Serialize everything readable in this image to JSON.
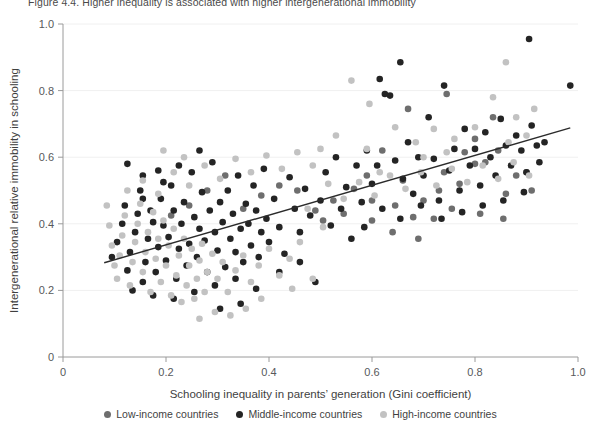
{
  "figure": {
    "title": "Figure 4.4. Higher inequality is associated with higher intergenerational immobility"
  },
  "legend": {
    "position": "bottom-center",
    "items": [
      {
        "label": "Low-income countries",
        "color": "#6e6e6e",
        "icon": "circle-marker-icon"
      },
      {
        "label": "Middle-income countries",
        "color": "#242424",
        "icon": "circle-marker-icon"
      },
      {
        "label": "High-income countries",
        "color": "#c2c2c2",
        "icon": "circle-marker-icon"
      }
    ]
  },
  "chart_data": {
    "type": "scatter",
    "title": "Figure 4.4. Higher inequality is associated with higher intergenerational immobility",
    "xlabel": "Schooling inequality in parents’ generation (Gini coefficient)",
    "ylabel": "Intergenerational relative immobility in schooling",
    "xlim": [
      0,
      1.0
    ],
    "ylim": [
      0,
      1.0
    ],
    "xticks": [
      0,
      0.2,
      0.4,
      0.6,
      0.8,
      1.0
    ],
    "xticklabels": [
      "0",
      "0.2",
      "0.4",
      "0.6",
      "0.8",
      "1.0"
    ],
    "yticks": [
      0,
      0.2,
      0.4,
      0.6,
      0.8,
      1.0
    ],
    "yticklabels": [
      "0",
      "0.2",
      "0.4",
      "0.6",
      "0.8",
      "1.0"
    ],
    "grid": "horizontal-light",
    "trendline": {
      "type": "linear",
      "x_start": 0.08,
      "y_start": 0.283,
      "x_end": 0.985,
      "y_end": 0.688,
      "color": "#2b2b2b",
      "width": 1.4
    },
    "series": [
      {
        "name": "Low-income countries",
        "color": "#6e6e6e",
        "points": [
          [
            0.62,
            0.62
          ],
          [
            0.66,
            0.53
          ],
          [
            0.7,
            0.47
          ],
          [
            0.74,
            0.555
          ],
          [
            0.78,
            0.615
          ],
          [
            0.8,
            0.58
          ],
          [
            0.82,
            0.585
          ],
          [
            0.845,
            0.62
          ],
          [
            0.86,
            0.49
          ],
          [
            0.88,
            0.545
          ],
          [
            0.9,
            0.555
          ],
          [
            0.91,
            0.5
          ],
          [
            0.755,
            0.445
          ],
          [
            0.72,
            0.415
          ],
          [
            0.68,
            0.42
          ],
          [
            0.645,
            0.455
          ],
          [
            0.6,
            0.47
          ],
          [
            0.565,
            0.505
          ],
          [
            0.525,
            0.47
          ],
          [
            0.49,
            0.44
          ],
          [
            0.455,
            0.5
          ],
          [
            0.42,
            0.515
          ],
          [
            0.385,
            0.485
          ],
          [
            0.35,
            0.445
          ],
          [
            0.6,
            0.41
          ],
          [
            0.64,
            0.375
          ],
          [
            0.69,
            0.355
          ],
          [
            0.73,
            0.5
          ],
          [
            0.77,
            0.52
          ],
          [
            0.81,
            0.43
          ],
          [
            0.855,
            0.415
          ],
          [
            0.67,
            0.745
          ],
          [
            0.745,
            0.79
          ],
          [
            0.505,
            0.41
          ],
          [
            0.545,
            0.43
          ],
          [
            0.59,
            0.545
          ],
          [
            0.315,
            0.545
          ],
          [
            0.28,
            0.5
          ],
          [
            0.245,
            0.455
          ],
          [
            0.21,
            0.425
          ],
          [
            0.8,
            0.655
          ],
          [
            0.835,
            0.72
          ]
        ]
      },
      {
        "name": "Middle-income countries",
        "color": "#242424",
        "points": [
          [
            0.095,
            0.3
          ],
          [
            0.105,
            0.345
          ],
          [
            0.115,
            0.4
          ],
          [
            0.12,
            0.455
          ],
          [
            0.125,
            0.26
          ],
          [
            0.13,
            0.315
          ],
          [
            0.14,
            0.375
          ],
          [
            0.145,
            0.43
          ],
          [
            0.15,
            0.5
          ],
          [
            0.155,
            0.225
          ],
          [
            0.16,
            0.285
          ],
          [
            0.165,
            0.355
          ],
          [
            0.17,
            0.44
          ],
          [
            0.175,
            0.405
          ],
          [
            0.18,
            0.255
          ],
          [
            0.185,
            0.33
          ],
          [
            0.19,
            0.475
          ],
          [
            0.195,
            0.395
          ],
          [
            0.2,
            0.29
          ],
          [
            0.205,
            0.36
          ],
          [
            0.21,
            0.515
          ],
          [
            0.215,
            0.44
          ],
          [
            0.22,
            0.235
          ],
          [
            0.225,
            0.325
          ],
          [
            0.23,
            0.4
          ],
          [
            0.235,
            0.465
          ],
          [
            0.24,
            0.275
          ],
          [
            0.245,
            0.34
          ],
          [
            0.25,
            0.555
          ],
          [
            0.255,
            0.42
          ],
          [
            0.26,
            0.3
          ],
          [
            0.265,
            0.385
          ],
          [
            0.27,
            0.495
          ],
          [
            0.275,
            0.35
          ],
          [
            0.28,
            0.255
          ],
          [
            0.285,
            0.44
          ],
          [
            0.29,
            0.585
          ],
          [
            0.295,
            0.375
          ],
          [
            0.3,
            0.32
          ],
          [
            0.305,
            0.465
          ],
          [
            0.31,
            0.405
          ],
          [
            0.315,
            0.27
          ],
          [
            0.32,
            0.5
          ],
          [
            0.325,
            0.355
          ],
          [
            0.33,
            0.43
          ],
          [
            0.335,
            0.315
          ],
          [
            0.34,
            0.545
          ],
          [
            0.345,
            0.385
          ],
          [
            0.35,
            0.285
          ],
          [
            0.355,
            0.46
          ],
          [
            0.36,
            0.4
          ],
          [
            0.365,
            0.335
          ],
          [
            0.37,
            0.515
          ],
          [
            0.375,
            0.44
          ],
          [
            0.38,
            0.3
          ],
          [
            0.385,
            0.375
          ],
          [
            0.39,
            0.565
          ],
          [
            0.395,
            0.415
          ],
          [
            0.4,
            0.345
          ],
          [
            0.41,
            0.475
          ],
          [
            0.42,
            0.39
          ],
          [
            0.43,
            0.31
          ],
          [
            0.44,
            0.54
          ],
          [
            0.45,
            0.445
          ],
          [
            0.46,
            0.375
          ],
          [
            0.47,
            0.505
          ],
          [
            0.48,
            0.425
          ],
          [
            0.49,
            0.225
          ],
          [
            0.5,
            0.47
          ],
          [
            0.51,
            0.555
          ],
          [
            0.52,
            0.395
          ],
          [
            0.53,
            0.6
          ],
          [
            0.54,
            0.445
          ],
          [
            0.55,
            0.51
          ],
          [
            0.56,
            0.355
          ],
          [
            0.57,
            0.575
          ],
          [
            0.58,
            0.465
          ],
          [
            0.59,
            0.62
          ],
          [
            0.6,
            0.52
          ],
          [
            0.61,
            0.575
          ],
          [
            0.615,
            0.835
          ],
          [
            0.625,
            0.79
          ],
          [
            0.635,
            0.785
          ],
          [
            0.645,
            0.59
          ],
          [
            0.655,
            0.885
          ],
          [
            0.66,
            0.535
          ],
          [
            0.67,
            0.645
          ],
          [
            0.68,
            0.49
          ],
          [
            0.69,
            0.6
          ],
          [
            0.7,
            0.545
          ],
          [
            0.71,
            0.72
          ],
          [
            0.72,
            0.595
          ],
          [
            0.73,
            0.47
          ],
          [
            0.74,
            0.815
          ],
          [
            0.75,
            0.56
          ],
          [
            0.76,
            0.625
          ],
          [
            0.77,
            0.5
          ],
          [
            0.78,
            0.685
          ],
          [
            0.79,
            0.575
          ],
          [
            0.8,
            0.625
          ],
          [
            0.81,
            0.515
          ],
          [
            0.82,
            0.675
          ],
          [
            0.83,
            0.6
          ],
          [
            0.84,
            0.545
          ],
          [
            0.85,
            0.715
          ],
          [
            0.86,
            0.635
          ],
          [
            0.87,
            0.575
          ],
          [
            0.88,
            0.665
          ],
          [
            0.89,
            0.62
          ],
          [
            0.9,
            0.555
          ],
          [
            0.905,
            0.955
          ],
          [
            0.91,
            0.695
          ],
          [
            0.92,
            0.635
          ],
          [
            0.925,
            0.585
          ],
          [
            0.935,
            0.645
          ],
          [
            0.985,
            0.815
          ],
          [
            0.155,
            0.545
          ],
          [
            0.185,
            0.56
          ],
          [
            0.225,
            0.575
          ],
          [
            0.265,
            0.62
          ],
          [
            0.135,
            0.2
          ],
          [
            0.175,
            0.185
          ],
          [
            0.215,
            0.175
          ],
          [
            0.255,
            0.195
          ],
          [
            0.295,
            0.215
          ],
          [
            0.335,
            0.235
          ],
          [
            0.375,
            0.205
          ],
          [
            0.42,
            0.255
          ],
          [
            0.46,
            0.285
          ],
          [
            0.305,
            0.145
          ],
          [
            0.345,
            0.16
          ],
          [
            0.125,
            0.58
          ],
          [
            0.155,
            0.475
          ],
          [
            0.195,
            0.525
          ],
          [
            0.585,
            0.39
          ],
          [
            0.62,
            0.445
          ],
          [
            0.655,
            0.415
          ],
          [
            0.695,
            0.455
          ],
          [
            0.735,
            0.415
          ],
          [
            0.775,
            0.435
          ],
          [
            0.815,
            0.455
          ],
          [
            0.855,
            0.47
          ],
          [
            0.895,
            0.495
          ]
        ]
      },
      {
        "name": "High-income countries",
        "color": "#c2c2c2",
        "points": [
          [
            0.085,
            0.455
          ],
          [
            0.09,
            0.395
          ],
          [
            0.095,
            0.335
          ],
          [
            0.1,
            0.275
          ],
          [
            0.105,
            0.235
          ],
          [
            0.11,
            0.305
          ],
          [
            0.115,
            0.365
          ],
          [
            0.12,
            0.425
          ],
          [
            0.125,
            0.5
          ],
          [
            0.13,
            0.215
          ],
          [
            0.135,
            0.285
          ],
          [
            0.14,
            0.345
          ],
          [
            0.145,
            0.4
          ],
          [
            0.15,
            0.46
          ],
          [
            0.155,
            0.255
          ],
          [
            0.16,
            0.315
          ],
          [
            0.165,
            0.375
          ],
          [
            0.17,
            0.195
          ],
          [
            0.175,
            0.435
          ],
          [
            0.18,
            0.295
          ],
          [
            0.185,
            0.355
          ],
          [
            0.19,
            0.225
          ],
          [
            0.195,
            0.41
          ],
          [
            0.2,
            0.275
          ],
          [
            0.205,
            0.335
          ],
          [
            0.21,
            0.185
          ],
          [
            0.215,
            0.385
          ],
          [
            0.22,
            0.245
          ],
          [
            0.225,
            0.305
          ],
          [
            0.23,
            0.165
          ],
          [
            0.235,
            0.355
          ],
          [
            0.24,
            0.215
          ],
          [
            0.245,
            0.275
          ],
          [
            0.25,
            0.325
          ],
          [
            0.255,
            0.175
          ],
          [
            0.26,
            0.235
          ],
          [
            0.265,
            0.29
          ],
          [
            0.27,
            0.34
          ],
          [
            0.275,
            0.195
          ],
          [
            0.28,
            0.255
          ],
          [
            0.29,
            0.31
          ],
          [
            0.3,
            0.235
          ],
          [
            0.31,
            0.285
          ],
          [
            0.32,
            0.195
          ],
          [
            0.335,
            0.26
          ],
          [
            0.35,
            0.305
          ],
          [
            0.365,
            0.225
          ],
          [
            0.38,
            0.275
          ],
          [
            0.4,
            0.325
          ],
          [
            0.42,
            0.245
          ],
          [
            0.44,
            0.295
          ],
          [
            0.46,
            0.345
          ],
          [
            0.155,
            0.53
          ],
          [
            0.185,
            0.49
          ],
          [
            0.215,
            0.555
          ],
          [
            0.245,
            0.515
          ],
          [
            0.275,
            0.575
          ],
          [
            0.305,
            0.535
          ],
          [
            0.335,
            0.595
          ],
          [
            0.365,
            0.555
          ],
          [
            0.395,
            0.605
          ],
          [
            0.425,
            0.565
          ],
          [
            0.455,
            0.615
          ],
          [
            0.485,
            0.575
          ],
          [
            0.515,
            0.52
          ],
          [
            0.545,
            0.475
          ],
          [
            0.575,
            0.525
          ],
          [
            0.605,
            0.485
          ],
          [
            0.635,
            0.545
          ],
          [
            0.665,
            0.505
          ],
          [
            0.695,
            0.555
          ],
          [
            0.725,
            0.515
          ],
          [
            0.755,
            0.565
          ],
          [
            0.785,
            0.525
          ],
          [
            0.815,
            0.575
          ],
          [
            0.845,
            0.535
          ],
          [
            0.875,
            0.585
          ],
          [
            0.905,
            0.545
          ],
          [
            0.5,
            0.625
          ],
          [
            0.53,
            0.665
          ],
          [
            0.56,
            0.83
          ],
          [
            0.595,
            0.76
          ],
          [
            0.645,
            0.69
          ],
          [
            0.685,
            0.645
          ],
          [
            0.72,
            0.685
          ],
          [
            0.76,
            0.655
          ],
          [
            0.8,
            0.69
          ],
          [
            0.835,
            0.78
          ],
          [
            0.86,
            0.885
          ],
          [
            0.88,
            0.72
          ],
          [
            0.915,
            0.745
          ],
          [
            0.265,
            0.115
          ],
          [
            0.295,
            0.135
          ],
          [
            0.325,
            0.125
          ],
          [
            0.355,
            0.145
          ],
          [
            0.385,
            0.175
          ],
          [
            0.475,
            0.445
          ],
          [
            0.505,
            0.39
          ],
          [
            0.235,
            0.6
          ],
          [
            0.195,
            0.62
          ],
          [
            0.59,
            0.625
          ],
          [
            0.615,
            0.555
          ],
          [
            0.7,
            0.6
          ],
          [
            0.745,
            0.615
          ],
          [
            0.865,
            0.645
          ],
          [
            0.9,
            0.665
          ],
          [
            0.445,
            0.205
          ],
          [
            0.485,
            0.235
          ]
        ]
      }
    ]
  }
}
